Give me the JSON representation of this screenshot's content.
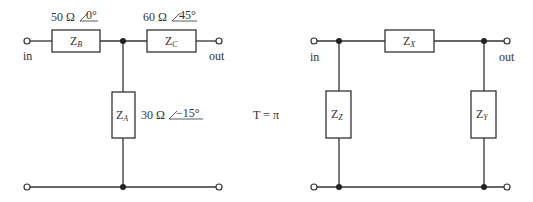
{
  "t_network": {
    "z_b": {
      "name": "Z",
      "sub": "B",
      "value": "50 Ω",
      "angle": "0°"
    },
    "z_c": {
      "name": "Z",
      "sub": "C",
      "value": "60 Ω",
      "angle": "45°"
    },
    "z_a": {
      "name": "Z",
      "sub": "A",
      "value": "30 Ω",
      "angle": "−15°"
    },
    "in_label": "in",
    "out_label": "out"
  },
  "equation": "T = π",
  "pi_network": {
    "z_x": {
      "name": "Z",
      "sub": "X"
    },
    "z_z": {
      "name": "Z",
      "sub": "Z"
    },
    "z_y": {
      "name": "Z",
      "sub": "Y"
    },
    "in_label": "in",
    "out_label": "out"
  },
  "colors": {
    "line": "#333333",
    "background": "#ffffff"
  }
}
